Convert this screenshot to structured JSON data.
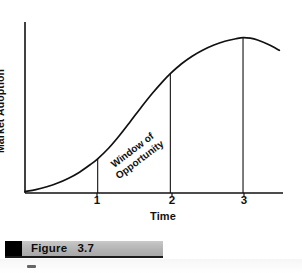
{
  "figure": {
    "caption_label": "Figure",
    "caption_number": "3.7",
    "caption_full": "Figure   3.7"
  },
  "chart_data": {
    "type": "line",
    "title": "",
    "subtitle": "",
    "xlabel": "Time",
    "ylabel": "Market Adoption",
    "xlim": [
      0,
      3.55
    ],
    "ylim": [
      0,
      1.1
    ],
    "grid": false,
    "legend_position": "none",
    "x_tick_labels": [
      "1",
      "2",
      "3"
    ],
    "x_tick_values": [
      1,
      2,
      3
    ],
    "y_tick_labels": [],
    "series": [
      {
        "name": "Market Adoption S-curve",
        "color": "#111111",
        "x": [
          0.0,
          0.15,
          0.3,
          0.45,
          0.6,
          0.75,
          0.9,
          1.0,
          1.15,
          1.3,
          1.45,
          1.6,
          1.75,
          1.9,
          2.0,
          2.15,
          2.3,
          2.45,
          2.6,
          2.75,
          2.9,
          3.0,
          3.1,
          3.2,
          3.35,
          3.5
        ],
        "y": [
          0.01,
          0.022,
          0.04,
          0.064,
          0.095,
          0.134,
          0.183,
          0.22,
          0.288,
          0.37,
          0.46,
          0.552,
          0.64,
          0.72,
          0.768,
          0.83,
          0.88,
          0.92,
          0.952,
          0.976,
          0.992,
          1.0,
          0.996,
          0.984,
          0.955,
          0.918
        ]
      }
    ],
    "drop_lines": [
      {
        "x": 1,
        "y_top": 0.22,
        "label": "1"
      },
      {
        "x": 2,
        "y_top": 0.768,
        "label": "2"
      },
      {
        "x": 3,
        "y_top": 1.0,
        "label": "3"
      }
    ],
    "annotations": [
      {
        "name": "window-of-opportunity",
        "lines": [
          "Window of",
          "Opportunity"
        ],
        "text": "Window of Opportunity",
        "x_range": [
          1,
          2
        ],
        "rotation_deg": -37
      }
    ],
    "axis_color": "#111111",
    "line_color": "#111111"
  },
  "annotation": {
    "line1": "Window of",
    "line2": "Opportunity"
  },
  "axes": {
    "y_title": "Market Adoption",
    "x_title": "Time",
    "ticks": [
      "1",
      "2",
      "3"
    ]
  },
  "colors": {
    "ink": "#111111",
    "caption_bar": "#bdbdbd",
    "caption_swatch": "#000000",
    "page_background": "#ffffff"
  }
}
